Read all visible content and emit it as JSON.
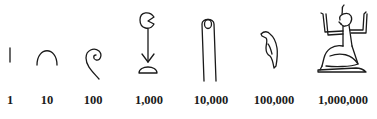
{
  "numerals": [
    {
      "value": "1",
      "glyph": "stroke-icon",
      "description": "single vertical stroke"
    },
    {
      "value": "10",
      "glyph": "heel-bone-icon",
      "description": "heel bone / arch"
    },
    {
      "value": "100",
      "glyph": "coil-of-rope-icon",
      "description": "coiled rope"
    },
    {
      "value": "1,000",
      "glyph": "lotus-plant-icon",
      "description": "lotus flower"
    },
    {
      "value": "10,000",
      "glyph": "finger-icon",
      "description": "raised finger"
    },
    {
      "value": "100,000",
      "glyph": "tadpole-bird-icon",
      "description": "tadpole / bird"
    },
    {
      "value": "1,000,000",
      "glyph": "kneeling-god-icon",
      "description": "god Heh with raised arms"
    }
  ],
  "colors": {
    "ink": "#1a1a1a",
    "background": "#ffffff"
  }
}
